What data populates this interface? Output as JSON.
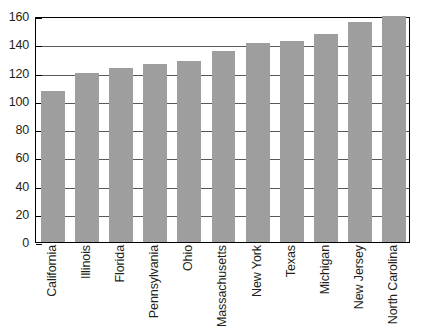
{
  "chart_data": {
    "type": "bar",
    "title": "",
    "subtitle": "",
    "xlabel": "",
    "ylabel": "",
    "ylim": [
      0,
      160
    ],
    "ytick_step": 20,
    "yticks": [
      160,
      140,
      120,
      100,
      80,
      60,
      40,
      20,
      0
    ],
    "grid": "horizontal",
    "legend": "none",
    "bar_color": "#9e9e9e",
    "axis_color": "#000000",
    "gridline_color": "#58585a",
    "categories": [
      "California",
      "Illinois",
      "Florida",
      "Pennsylvania",
      "Ohio",
      "Massachusetts",
      "New York",
      "Texas",
      "Michigan",
      "New Jersey",
      "North Carolina"
    ],
    "values": [
      107,
      120,
      123,
      126,
      128,
      135,
      141,
      142,
      147,
      156,
      160
    ],
    "series": [
      {
        "name": "",
        "values": [
          107,
          120,
          123,
          126,
          128,
          135,
          141,
          142,
          147,
          156,
          160
        ]
      }
    ]
  }
}
